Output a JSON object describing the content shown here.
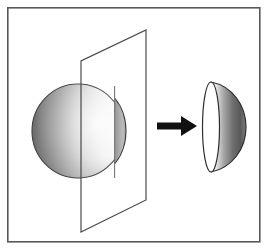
{
  "figure": {
    "title": "Sphere cut by a plane yielding a hemisphere",
    "canvas": {
      "width": 268,
      "height": 248,
      "background": "#ffffff"
    },
    "frame": {
      "name": "outer-border",
      "x": 7,
      "y": 7,
      "width": 253,
      "height": 235,
      "stroke": "#59595b",
      "stroke_width": 1.6,
      "fill": "#ffffff"
    },
    "sphere": {
      "label": "sphere",
      "center_x": 78,
      "center_y": 131,
      "radius_x": 46,
      "radius_y": 47,
      "stroke": "#3a3a3a",
      "stroke_width": 1.1,
      "shading": {
        "type": "linear-gradient",
        "direction": "left-to-right",
        "stops": [
          "#6e6e6e",
          "#9a9a9a",
          "#d3d3d3",
          "#f2f2f2",
          "#fdfdfd"
        ]
      }
    },
    "cutting_plane": {
      "label": "cutting-plane",
      "points": [
        {
          "x": 146,
          "y": 30
        },
        {
          "x": 146,
          "y": 200
        },
        {
          "x": 81,
          "y": 232
        },
        {
          "x": 81,
          "y": 61
        }
      ],
      "stroke": "#4a4a4a",
      "stroke_width": 1.2,
      "fill": "none"
    },
    "front_cap": {
      "label": "front-spherical-cap",
      "description": "crescent of sphere in front of the plane",
      "stroke": "#3a3a3a",
      "stroke_width": 1.1,
      "shading": {
        "type": "linear-gradient",
        "direction": "left-to-right",
        "stops": [
          "#4e4e4e",
          "#7d7d7d",
          "#a8a8a8",
          "#c2c2c2"
        ]
      }
    },
    "arrow": {
      "label": "transformation-arrow",
      "direction": "right",
      "tail_x": 157,
      "tip_x": 197,
      "y": 126,
      "shaft_thickness": 7,
      "head_length": 16,
      "head_half_height": 11,
      "color": "#111111"
    },
    "result_hemisphere": {
      "label": "resulting-hemisphere",
      "center_x": 224,
      "center_y": 127,
      "flat_face": {
        "name": "elliptical-flat-face",
        "rx": 8,
        "ry": 47,
        "fill": "#ffffff",
        "stroke": "#2e2e2e",
        "stroke_width": 1.2
      },
      "dome": {
        "name": "curved-dome",
        "max_x": 246,
        "stroke": "#2e2e2e",
        "stroke_width": 1.2,
        "shading": {
          "type": "linear-gradient",
          "direction": "left-to-right",
          "stops": [
            "#ffffff",
            "#bdbdbd",
            "#7c7c7c",
            "#5b5b5b",
            "#7a7a7a"
          ]
        }
      }
    },
    "palette": {
      "background": "#ffffff",
      "border": "#59595b",
      "outline": "#2e2e2e",
      "arrow": "#111111",
      "shade_dark": "#4e4e4e",
      "shade_mid": "#9a9a9a",
      "shade_light": "#f2f2f2"
    }
  }
}
